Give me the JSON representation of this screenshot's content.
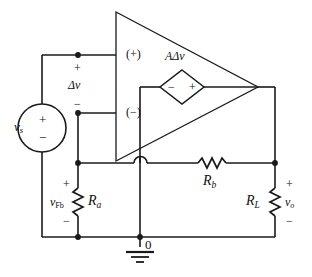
{
  "figure": {
    "kind": "circuit-diagram",
    "background_color": "#ffffff",
    "line_color": "#1a1a1a",
    "text_color": "#111111"
  },
  "labels": {
    "source": {
      "name": "v",
      "subscript": "s",
      "plus": "+",
      "minus": "−"
    },
    "diff_input": {
      "name": "Δv",
      "plus": "+",
      "minus": "−"
    },
    "opamp_noninverting_terminal": "(+)",
    "opamp_inverting_terminal": "(−)",
    "dependent_source": {
      "name": "AΔv",
      "plus": "+",
      "minus": "−"
    },
    "resistor_a": {
      "name": "R",
      "subscript": "a"
    },
    "resistor_b": {
      "name": "R",
      "subscript": "b"
    },
    "resistor_load": {
      "name": "R",
      "subscript": "L"
    },
    "feedback_voltage": {
      "name": "v",
      "subscript": "Fb",
      "plus": "+",
      "minus": "−"
    },
    "output_voltage": {
      "name": "v",
      "subscript": "o",
      "plus": "+",
      "minus": "−"
    },
    "ground_node": "0"
  },
  "components": [
    {
      "id": "vs",
      "type": "independent-voltage-source",
      "label": "vs"
    },
    {
      "id": "opamp",
      "type": "operational-amplifier-triangle",
      "terminals": [
        "(+)",
        "(−)"
      ]
    },
    {
      "id": "dep-src",
      "type": "dependent-voltage-source-diamond",
      "label": "AΔv"
    },
    {
      "id": "ra",
      "type": "resistor",
      "label": "Ra",
      "orientation": "vertical"
    },
    {
      "id": "rb",
      "type": "resistor",
      "label": "Rb",
      "orientation": "horizontal"
    },
    {
      "id": "rl",
      "type": "resistor",
      "label": "RL",
      "orientation": "vertical"
    },
    {
      "id": "gnd",
      "type": "ground-symbol",
      "label": "0"
    }
  ],
  "nodes": [
    {
      "id": "n-plus",
      "x": 78,
      "y": 55
    },
    {
      "id": "n-minus",
      "x": 78,
      "y": 113
    },
    {
      "id": "n-fb-top",
      "x": 78,
      "y": 163
    },
    {
      "id": "n-fb-bot",
      "x": 78,
      "y": 237
    },
    {
      "id": "n-ground",
      "x": 140,
      "y": 237
    },
    {
      "id": "n-out-top",
      "x": 275,
      "y": 163
    }
  ]
}
